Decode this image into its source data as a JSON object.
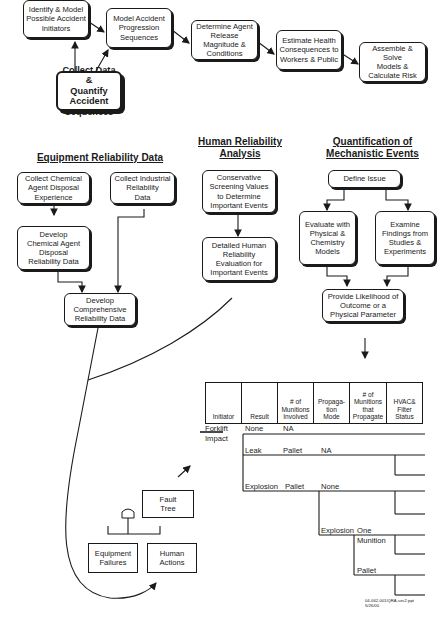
{
  "flow": {
    "identify": "Identify & Model\nPossible Accident\nInitiators",
    "model": "Model Accident\nProgression\nSequences",
    "determine": "Determine Agent\nRelease\nMagnitude &\nConditions",
    "estimate": "Estimate Health\nConsequences to\nWorkers & Public",
    "assemble": "Assemble & Solve\nModels &\nCalculate Risk",
    "collect": "Collect Data &\nQuantify\nAccident\nSequences"
  },
  "equipment": {
    "title": "Equipment Reliability Data",
    "collect_chemical": "Collect Chemical\nAgent Disposal\nExperience",
    "collect_industrial": "Collect Industrial\nReliability\nData",
    "develop_chemical": "Develop\nChemical Agent\nDisposal\nReliability Data",
    "develop_comprehensive": "Develop\nComprehensive\nReliability Data"
  },
  "human": {
    "title": "Human Reliability\nAnalysis",
    "screening": "Conservative\nScreening Values\nto Determine\nImportant Events",
    "detailed": "Detailed Human\nReliability\nEvaluation for\nImportant Events"
  },
  "mechanistic": {
    "title": "Quantification of\nMechanistic Events",
    "define": "Define Issue",
    "evaluate": "Evaluate with\nPhysical &\nChemistry\nModels",
    "examine": "Examine\nFindings from\nStudies &\nExperiments",
    "provide": "Provide Likelihood of\nOutcome or a\nPhysical Parameter"
  },
  "fault_tree": {
    "top": "Fault\nTree",
    "equipment": "Equipment\nFailures",
    "human": "Human\nActions"
  },
  "event_tree": {
    "headers": [
      "Initiator",
      "Result",
      "# of\nMunitions\nInvolved",
      "Propaga-\ntion\nMode",
      "# of\nMunitions\nthat\nPropagate",
      "HVAC&\nFilter\nStatus"
    ],
    "initiator_1": "Forklift",
    "initiator_2": "Impact",
    "none": "None",
    "na1": "NA",
    "leak": "Leak",
    "pallet1": "Pallet",
    "na2": "NA",
    "explosion": "Explosion",
    "pallet2": "Pallet",
    "none2": "None",
    "explosion2": "Explosion",
    "one": "One",
    "munition": "Munition",
    "pallet3": "Pallet"
  },
  "footer": {
    "ref": "04-062-001/QRA-sec2.ppt\n5/26/00"
  }
}
